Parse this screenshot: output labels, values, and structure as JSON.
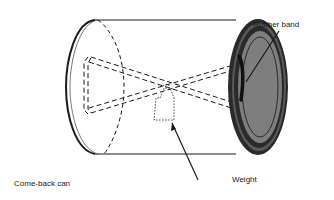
{
  "diagram": {
    "caption": "Come-back can",
    "labels": {
      "rubber_band": "Rubber band",
      "weight": "Weight"
    },
    "colors": {
      "stroke": "#1a1a1a",
      "lid_fill": "#7a7a7a",
      "lid_inner": "#8c8c8c",
      "background": "#ffffff"
    }
  }
}
